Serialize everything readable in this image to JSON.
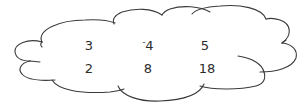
{
  "diagram": {
    "shape": "cloud",
    "stroke_color": "#3a3a3a",
    "text_color": "#2b2b2b",
    "rows": [
      [
        {
          "sign": "",
          "value": "3"
        },
        {
          "sign": "-",
          "value": "4"
        },
        {
          "sign": "",
          "value": "5"
        }
      ],
      [
        {
          "sign": "",
          "value": "2"
        },
        {
          "sign": "",
          "value": "8"
        },
        {
          "sign": "",
          "value": "18"
        }
      ]
    ]
  }
}
